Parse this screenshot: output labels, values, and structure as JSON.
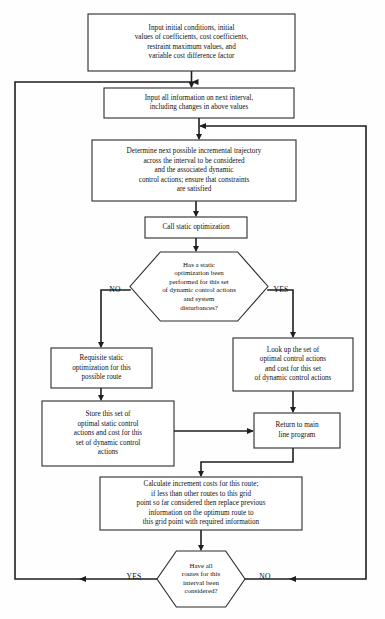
{
  "diagram": {
    "type": "flowchart",
    "colors": {
      "background": "#fefefe",
      "box_fill": "#ffffff",
      "box_stroke": "#2a2a2a",
      "connector": "#1e1e1e",
      "text": "#111111"
    },
    "nodes": [
      {
        "id": "input-initial-conditions",
        "shape": "rectangle",
        "x": 88,
        "y": 14,
        "w": 207,
        "h": 57,
        "lines": [
          "Input initial conditions, initial",
          "values of coefficients, cost coefficients,",
          "restraint maximum values, and",
          "variable cost difference factor"
        ]
      },
      {
        "id": "input-next-interval",
        "shape": "rectangle",
        "x": 104,
        "y": 88,
        "w": 190,
        "h": 30,
        "lines": [
          "Input all information on next interval,",
          "including changes in above values"
        ]
      },
      {
        "id": "determine-trajectory",
        "shape": "rectangle",
        "x": 92,
        "y": 140,
        "w": 204,
        "h": 61,
        "lines": [
          "Determine next possible incremental trajectory",
          "across the interval to be considered",
          "and the associated dynamic",
          "control actions; ensure that constraints",
          "are satisfied"
        ]
      },
      {
        "id": "call-static-optimization",
        "shape": "rectangle",
        "x": 145,
        "y": 217,
        "w": 102,
        "h": 21,
        "lines": [
          "Call static optimization"
        ]
      },
      {
        "id": "has-static-optimization-been-performed",
        "shape": "hexagon",
        "x": 130,
        "y": 252,
        "w": 138,
        "h": 69,
        "lines": [
          "Has a static",
          "optimization been",
          "performed for this set",
          "of dynamic control actions",
          "and system",
          "disturbances?"
        ]
      },
      {
        "id": "requisite-static-optimization",
        "shape": "rectangle",
        "x": 51,
        "y": 348,
        "w": 101,
        "h": 40,
        "lines": [
          "Requisite static",
          "optimization for this",
          "possible route"
        ]
      },
      {
        "id": "look-up-optimal-control-actions",
        "shape": "rectangle",
        "x": 233,
        "y": 338,
        "w": 120,
        "h": 53,
        "lines": [
          "Look up the set of",
          "optimal control actions",
          "and cost for this set",
          "of dynamic control actions"
        ]
      },
      {
        "id": "store-optimal-static-control-actions",
        "shape": "rectangle",
        "x": 42,
        "y": 401,
        "w": 132,
        "h": 65,
        "lines": [
          "Store this set of",
          "optimal static control",
          "actions and cost for this",
          "set of dynamic control",
          "actions"
        ]
      },
      {
        "id": "return-to-main-line-program",
        "shape": "rectangle",
        "x": 254,
        "y": 413,
        "w": 86,
        "h": 35,
        "lines": [
          "Return to main",
          "line program"
        ]
      },
      {
        "id": "calculate-increment-costs",
        "shape": "rectangle",
        "x": 100,
        "y": 477,
        "w": 202,
        "h": 53,
        "lines": [
          "Calculate increment costs for this route;",
          "if less than other routes to this grid",
          "point so far considered then replace previous",
          "information on the optimum route to",
          "this grid point with required information"
        ]
      },
      {
        "id": "have-all-routes-been-considered",
        "shape": "hexagon",
        "x": 157,
        "y": 551,
        "w": 88,
        "h": 56,
        "lines": [
          "Have all",
          "routes for this",
          "interval been",
          "considered?"
        ]
      }
    ],
    "branch_labels": [
      {
        "id": "decision1-no",
        "text": "NO",
        "x": 115,
        "y": 290
      },
      {
        "id": "decision1-yes",
        "text": "YES",
        "x": 281,
        "y": 290
      },
      {
        "id": "decision2-yes",
        "text": "YES",
        "x": 134,
        "y": 577
      },
      {
        "id": "decision2-no",
        "text": "NO",
        "x": 265,
        "y": 577
      }
    ],
    "connectors": [
      {
        "id": "conn-input-to-interval",
        "path": "M 191.5 71 L 191.5 86",
        "arrow": "down",
        "ax": 191.5,
        "ay": 87
      },
      {
        "id": "conn-interval-to-determine",
        "path": "M 199 118 L 199 138",
        "arrow": "down",
        "ax": 199,
        "ay": 139
      },
      {
        "id": "conn-determine-to-call",
        "path": "M 196 201 L 196 215",
        "arrow": "down",
        "ax": 196,
        "ay": 216
      },
      {
        "id": "conn-call-to-decision1",
        "path": "M 196 238 L 196 250",
        "arrow": "down",
        "ax": 196,
        "ay": 251
      },
      {
        "id": "conn-decision1-no",
        "path": "M 130 290 L 101 290 L 101 346",
        "arrow": "down",
        "ax": 101,
        "ay": 347
      },
      {
        "id": "conn-decision1-yes",
        "path": "M 268 290 L 293 290 L 293 336",
        "arrow": "down",
        "ax": 293,
        "ay": 337
      },
      {
        "id": "conn-requisite-to-store",
        "path": "M 101 388 L 101 399",
        "arrow": "down",
        "ax": 101,
        "ay": 400
      },
      {
        "id": "conn-lookup-to-return",
        "path": "M 293 391 L 293 411",
        "arrow": "down",
        "ax": 293,
        "ay": 412
      },
      {
        "id": "conn-store-to-return",
        "path": "M 174 431 L 252 431",
        "arrow": "right",
        "ax": 253,
        "ay": 431
      },
      {
        "id": "conn-return-to-calculate",
        "path": "M 293 448 L 293 462 L 201 462 L 201 475",
        "arrow": "down",
        "ax": 201,
        "ay": 476
      },
      {
        "id": "conn-calculate-to-decision2",
        "path": "M 201 530 L 201 549",
        "arrow": "down",
        "ax": 201,
        "ay": 550
      },
      {
        "id": "conn-decision2-no-feedback",
        "path": "M 245 579 L 366 579 L 366 126 L 201 126",
        "arrow": "left-and-mid",
        "ax": 200,
        "ay": 126,
        "mx": 290,
        "my": 579
      },
      {
        "id": "conn-decision2-yes-feedback",
        "path": "M 157 579 L 15 579 L 15 82 L 191.5 82",
        "arrow": "left-and-mid",
        "ax": 192.5,
        "ay": 82,
        "mx": 80,
        "my": 579
      }
    ]
  }
}
